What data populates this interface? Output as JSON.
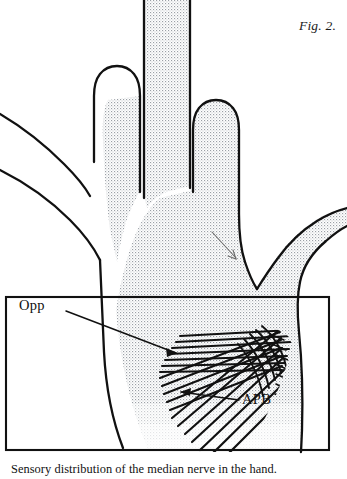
{
  "figure": {
    "number_label": "Fig. 2.",
    "caption": "Sensory distribution of the median nerve in the hand.",
    "title_alt": "Sensory distribution of the median nerve in the hand"
  },
  "annotations": [
    {
      "id": "opp",
      "label": "Opp",
      "meaning": "Opponens pollicis muscle",
      "label_x": 19,
      "label_y": 297,
      "leader_from": [
        66,
        311
      ],
      "leader_to": [
        176,
        353
      ]
    },
    {
      "id": "apb",
      "label": "APB",
      "meaning": "Abductor pollicis brevis muscle",
      "label_x": 242,
      "label_y": 391,
      "leader_from": [
        239,
        400
      ],
      "leader_to": [
        181,
        392
      ]
    }
  ],
  "colors": {
    "ink": "#111111",
    "outline": "#111111",
    "stipple_dot": "#9aa0a6",
    "muscle_fiber": "#111111",
    "box_border": "#111111",
    "background": "#ffffff"
  },
  "drawing": {
    "type": "anatomical-line-drawing",
    "subject": "right hand, palmar view",
    "shading": "stipple dot pattern marks median nerve sensory territory",
    "hatching": "dark parallel striations mark thenar muscles",
    "inset_box": {
      "x": 5,
      "y": 296,
      "width": 325,
      "height": 155
    },
    "stipple_spacing_px": 3,
    "fingers_shaded": [
      "thumb",
      "index",
      "middle",
      "radial-half-of-ring"
    ],
    "fingers_unshaded": [
      "little",
      "ulnar-half-of-ring"
    ]
  }
}
